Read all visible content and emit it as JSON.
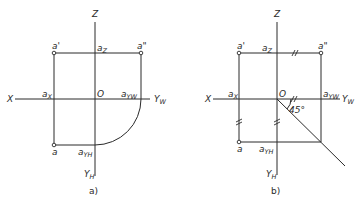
{
  "diagrams": [
    {
      "id": "a",
      "caption": "a)",
      "axes": {
        "x": "X",
        "z": "Z",
        "yw": "Y",
        "yw_sub": "W",
        "yh": "Y",
        "yh_sub": "H",
        "origin": "O"
      },
      "points": {
        "a_prime": "a'",
        "a_double_prime": "a\"",
        "a": "a",
        "az": "a",
        "az_sub": "Z",
        "ax": "a",
        "ax_sub": "X",
        "ayw": "a",
        "ayw_sub": "YW",
        "ayh": "a",
        "ayh_sub": "YH"
      },
      "construction": "quarter-circle arc"
    },
    {
      "id": "b",
      "caption": "b)",
      "axes": {
        "x": "X",
        "z": "Z",
        "yw": "Y",
        "yw_sub": "W",
        "yh": "Y",
        "yh_sub": "H",
        "origin": "O"
      },
      "points": {
        "a_prime": "a'",
        "a_double_prime": "a\"",
        "a": "a",
        "az": "a",
        "az_sub": "Z",
        "ax": "a",
        "ax_sub": "X",
        "ayw": "a",
        "ayw_sub": "YW",
        "ayh": "a",
        "ayh_sub": "YH"
      },
      "angle_label": "45°",
      "construction": "45-degree line"
    }
  ]
}
